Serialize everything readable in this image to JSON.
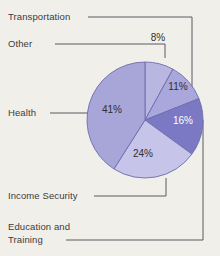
{
  "figure": {
    "background_color": "#f1efe9",
    "leader_line_color": "#5a5a60"
  },
  "chart_data": {
    "type": "pie",
    "title": "",
    "xlabel": "",
    "ylabel": "",
    "legend_position": "callout-labels",
    "grid": false,
    "start_angle_deg": 0,
    "direction": "clockwise",
    "categories": [
      "Other",
      "Transportation",
      "Education and Training",
      "Income Security",
      "Health"
    ],
    "values": [
      8,
      11,
      16,
      24,
      41
    ],
    "value_labels": [
      "8%",
      "11%",
      "16%",
      "24%",
      "41%"
    ],
    "colors": [
      "#b9b7e2",
      "#a9a7dc",
      "#7b78c4",
      "#c6c4e8",
      "#a8a5d8"
    ],
    "slices": [
      {
        "label": "Other",
        "value": 8,
        "value_label": "8%",
        "color": "#b9b7e2",
        "label_text_color": "#2f2f35"
      },
      {
        "label": "Transportation",
        "value": 11,
        "value_label": "11%",
        "color": "#a9a7dc",
        "label_text_color": "#2f2f35"
      },
      {
        "label": "Education and Training",
        "value": 16,
        "value_label": "16%",
        "color": "#7b78c4",
        "label_text_color": "#ffffff"
      },
      {
        "label": "Income Security",
        "value": 24,
        "value_label": "24%",
        "color": "#c6c4e8",
        "label_text_color": "#2f2f35"
      },
      {
        "label": "Health",
        "value": 41,
        "value_label": "41%",
        "color": "#a8a5d8",
        "label_text_color": "#2f2f35"
      }
    ],
    "total": 100
  },
  "callouts": {
    "transportation": "Transportation",
    "other": "Other",
    "health": "Health",
    "income_security": "Income Security",
    "education_line1": "Education and",
    "education_line2": "Training"
  },
  "percent_labels": {
    "other": "8%",
    "transportation": "11%",
    "education": "16%",
    "income_security": "24%",
    "health": "41%"
  }
}
